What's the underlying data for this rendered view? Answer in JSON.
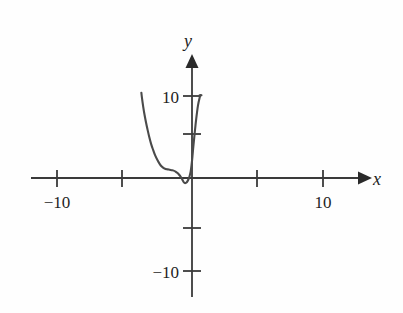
{
  "figure": {
    "background_color": "#fefefe",
    "axis_color": "#3a3a3a",
    "curve_color": "#4a4a4a",
    "text_color": "#1f1f1f"
  },
  "axes": {
    "x_axis_label": "x",
    "y_axis_label": "y",
    "x_tick_labels": [
      "-10",
      "10"
    ],
    "y_tick_labels": [
      "10",
      "-10"
    ],
    "x_label_neg10": "−10",
    "x_label_pos10": "10",
    "y_label_pos10": "10",
    "y_label_neg10": "−10"
  },
  "chart_data": {
    "type": "line",
    "title": "",
    "subtitle": "",
    "xlabel": "x",
    "ylabel": "y",
    "xlim": [
      -12.5,
      13.5
    ],
    "ylim": [
      -14.5,
      14.5
    ],
    "grid": false,
    "legend": null,
    "x_ticks": [
      -10,
      -5,
      5,
      10
    ],
    "x_tick_labels_shown": [
      "-10",
      "",
      "",
      "10"
    ],
    "y_ticks": [
      -10,
      -5,
      5,
      10
    ],
    "y_tick_labels_shown": [
      "-10",
      "",
      "",
      "10"
    ],
    "axis_arrows": [
      "x-positive",
      "y-positive"
    ],
    "series": [
      {
        "name": "curve",
        "x": [
          -3.85,
          -3.8,
          -3.72,
          -3.62,
          -3.5,
          -3.38,
          -3.25,
          -3.1,
          -2.95,
          -2.8,
          -2.62,
          -2.45,
          -2.3,
          -2.15,
          -2.0,
          -1.85,
          -1.7,
          -1.55,
          -1.4,
          -1.25,
          -1.1,
          -0.98,
          -0.86,
          -0.75,
          -0.66,
          -0.58,
          -0.5,
          -0.42,
          -0.34,
          -0.26,
          -0.18,
          -0.1,
          -0.04,
          0.02,
          0.1,
          0.2,
          0.32,
          0.45,
          0.58,
          0.66
        ],
        "y": [
          10.4,
          9.7,
          8.8,
          7.8,
          6.8,
          5.9,
          5.0,
          4.1,
          3.4,
          2.75,
          2.15,
          1.7,
          1.4,
          1.2,
          1.1,
          1.05,
          1.0,
          0.95,
          0.9,
          0.78,
          0.6,
          0.4,
          0.15,
          -0.15,
          -0.42,
          -0.58,
          -0.62,
          -0.55,
          -0.38,
          -0.12,
          0.25,
          0.8,
          1.5,
          2.4,
          3.8,
          5.4,
          7.2,
          8.8,
          9.8,
          10.1
        ]
      }
    ],
    "curve_endpoint_marker": {
      "note": "right branch ends with a short horizontal cap at y = 10",
      "cap_x_from": 0.58,
      "cap_x_to": 0.72,
      "cap_y": 10.1
    }
  }
}
